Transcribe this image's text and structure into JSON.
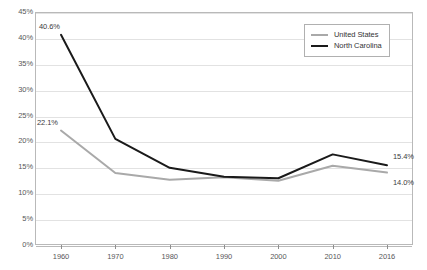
{
  "chart_data": {
    "type": "line",
    "title": "",
    "subtitle": "",
    "xlabel": "",
    "ylabel": "",
    "x": [
      "1960",
      "1970",
      "1980",
      "1990",
      "2000",
      "2010",
      "2016"
    ],
    "categories": [
      "1960",
      "1970",
      "1980",
      "1990",
      "2000",
      "2010",
      "2016"
    ],
    "ylim": [
      0,
      45
    ],
    "ytick_labels": [
      "45%",
      "40%",
      "35%",
      "30%",
      "25%",
      "20%",
      "15%",
      "10%",
      "5%",
      "0%"
    ],
    "ytick_values": [
      45,
      40,
      35,
      30,
      25,
      20,
      15,
      10,
      5,
      0
    ],
    "grid": true,
    "legend_position": "top-right",
    "series": [
      {
        "name": "United States",
        "color": "#a9a9a9",
        "values": [
          22.1,
          13.9,
          12.6,
          13.1,
          12.4,
          15.3,
          14.0
        ]
      },
      {
        "name": "North Carolina",
        "color": "#1a1a1a",
        "values": [
          40.6,
          20.5,
          14.9,
          13.2,
          12.9,
          17.5,
          15.4
        ]
      }
    ],
    "annotations": [
      {
        "text": "40.6%",
        "series": "North Carolina",
        "x": "1960",
        "value": 40.6
      },
      {
        "text": "22.1%",
        "series": "United States",
        "x": "1960",
        "value": 22.1
      },
      {
        "text": "15.4%",
        "series": "North Carolina",
        "x": "2016",
        "value": 15.4
      },
      {
        "text": "14.0%",
        "series": "United States",
        "x": "2016",
        "value": 14.0
      }
    ]
  },
  "legend": {
    "items": [
      {
        "label": "United States",
        "color": "#a9a9a9"
      },
      {
        "label": "North Carolina",
        "color": "#1a1a1a"
      }
    ]
  }
}
